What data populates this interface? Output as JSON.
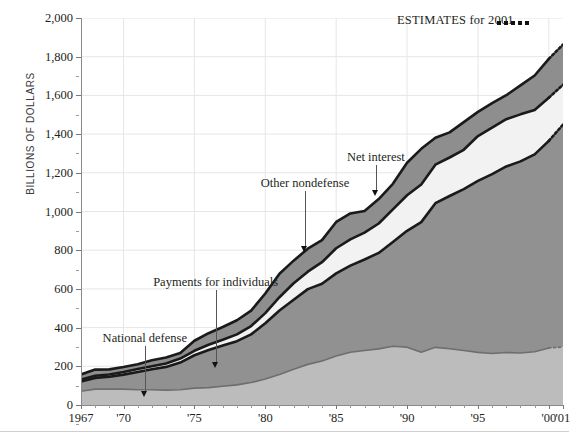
{
  "chart_data": {
    "type": "area",
    "stacked": true,
    "title": "",
    "xlabel": "",
    "ylabel": "BILLIONS OF DOLLARS",
    "ylim": [
      0,
      2000
    ],
    "ytick_values": [
      0,
      200,
      400,
      600,
      800,
      1000,
      1200,
      1400,
      1600,
      1800,
      2000
    ],
    "ytick_labels": [
      "0",
      "200",
      "400",
      "600",
      "800",
      "1,000",
      "1,200",
      "1,400",
      "1,600",
      "1,800",
      "2,000"
    ],
    "xlim": [
      1967,
      2001
    ],
    "xtick_values": [
      1967,
      1970,
      1975,
      1980,
      1985,
      1990,
      1995,
      2000,
      2001
    ],
    "xtick_labels": [
      "1967",
      "'70",
      "'75",
      "'80",
      "'85",
      "'90",
      "'95",
      "'00",
      "'01"
    ],
    "grid": "horizontal-and-vertical-light",
    "legend_position": "inline-annotations",
    "x": [
      1967,
      1968,
      1969,
      1970,
      1971,
      1972,
      1973,
      1974,
      1975,
      1976,
      1977,
      1978,
      1979,
      1980,
      1981,
      1982,
      1983,
      1984,
      1985,
      1986,
      1987,
      1988,
      1989,
      1990,
      1991,
      1992,
      1993,
      1994,
      1995,
      1996,
      1997,
      1998,
      1999,
      2000,
      2001
    ],
    "series": [
      {
        "name": "National defense",
        "color": "#bcbcbc",
        "values": [
          71,
          82,
          82,
          82,
          79,
          79,
          77,
          79,
          87,
          90,
          97,
          104,
          116,
          134,
          158,
          185,
          210,
          227,
          253,
          273,
          282,
          290,
          304,
          299,
          273,
          298,
          291,
          282,
          272,
          266,
          271,
          269,
          275,
          295,
          299
        ]
      },
      {
        "name": "Payments for individuals",
        "color": "#919191",
        "values": [
          50,
          58,
          64,
          75,
          92,
          106,
          120,
          140,
          170,
          194,
          210,
          226,
          249,
          288,
          330,
          359,
          389,
          400,
          427,
          447,
          470,
          496,
          538,
          601,
          672,
          745,
          789,
          834,
          886,
          927,
          962,
          990,
          1020,
          1070,
          1150
        ]
      },
      {
        "name": "Net interest",
        "color": "#f2f2f2",
        "values": [
          10,
          11,
          12,
          14,
          15,
          15,
          17,
          21,
          23,
          27,
          30,
          35,
          43,
          53,
          69,
          85,
          90,
          111,
          130,
          136,
          139,
          152,
          169,
          184,
          195,
          199,
          199,
          203,
          232,
          241,
          244,
          243,
          230,
          223,
          206
        ]
      },
      {
        "name": "Other nondefense",
        "color": "#8e8e8e",
        "values": [
          27,
          32,
          26,
          25,
          25,
          31,
          32,
          29,
          52,
          60,
          66,
          73,
          80,
          101,
          121,
          117,
          119,
          114,
          136,
          134,
          112,
          126,
          132,
          168,
          184,
          139,
          130,
          143,
          125,
          126,
          124,
          150,
          178,
          201,
          208
        ]
      }
    ],
    "estimate_note": "ESTIMATES for 2001",
    "estimate_from_year": 2000,
    "annotations": [
      {
        "label": "National defense",
        "target_year": 1971.5,
        "target_value": 40
      },
      {
        "label": "Payments for individuals",
        "target_year": 1976.5,
        "target_value": 190
      },
      {
        "label": "Other nondefense",
        "target_year": 1982.8,
        "target_value": 790
      },
      {
        "label": "Net interest",
        "target_year": 1987.8,
        "target_value": 1080
      }
    ]
  },
  "chart": {
    "ylabel": "BILLIONS OF DOLLARS",
    "estimates_label": "ESTIMATES for 2001"
  }
}
